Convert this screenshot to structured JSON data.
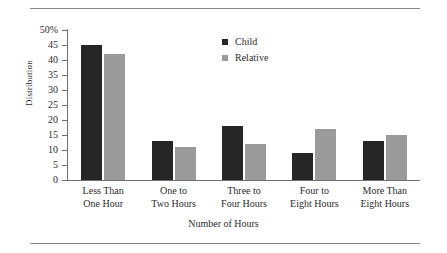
{
  "chart_data": {
    "type": "bar",
    "title": "",
    "xlabel": "Number of Hours",
    "ylabel": "Distribution",
    "categories": [
      "Less Than One Hour",
      "One to Two Hours",
      "Three to Four Hours",
      "Four to Eight Hours",
      "More Than Eight Hours"
    ],
    "category_lines": [
      [
        "Less Than",
        "One Hour"
      ],
      [
        "One to",
        "Two Hours"
      ],
      [
        "Three to",
        "Four Hours"
      ],
      [
        "Four to",
        "Eight Hours"
      ],
      [
        "More Than",
        "Eight Hours"
      ]
    ],
    "series": [
      {
        "name": "Child",
        "color": "#262626",
        "values": [
          45,
          13,
          18,
          9,
          13
        ]
      },
      {
        "name": "Relative",
        "color": "#9a9a9a",
        "values": [
          42,
          11,
          12,
          17,
          15
        ]
      }
    ],
    "ylim": [
      0,
      50
    ],
    "ytick_values": [
      50,
      45,
      40,
      35,
      30,
      25,
      20,
      15,
      10,
      5,
      0
    ],
    "ytick_labels": [
      "50%",
      "45",
      "40",
      "35",
      "30",
      "25",
      "20",
      "15",
      "10",
      "5",
      "0"
    ],
    "grid": false,
    "legend_position": "top-center-right"
  },
  "legend": {
    "entries": [
      {
        "label": "Child"
      },
      {
        "label": "Relative"
      }
    ]
  }
}
